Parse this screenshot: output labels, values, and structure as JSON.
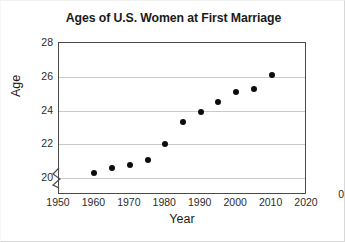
{
  "chart_data": {
    "type": "scatter",
    "title": "Ages of U.S. Women at First Marriage",
    "xlabel": "Year",
    "ylabel": "Age",
    "x": [
      1960,
      1965,
      1970,
      1975,
      1980,
      1985,
      1990,
      1995,
      2000,
      2005,
      2010
    ],
    "values": [
      20.3,
      20.6,
      20.8,
      21.1,
      22.0,
      23.3,
      23.9,
      24.5,
      25.1,
      25.3,
      26.1
    ],
    "xlim": [
      1950,
      2020
    ],
    "ylim": [
      19.0,
      28.0
    ],
    "y_tick_labels": [
      "28",
      "26",
      "24",
      "22",
      "20"
    ],
    "y_tick_values": [
      28,
      26,
      24,
      22,
      20
    ],
    "y_origin_label": "0",
    "x_tick_labels": [
      "1950",
      "1960",
      "1970",
      "1980",
      "1990",
      "2000",
      "2010",
      "2020"
    ],
    "x_tick_values": [
      1950,
      1960,
      1970,
      1980,
      1990,
      2000,
      2010,
      2020
    ],
    "grid": true,
    "grid_axis": "y",
    "legend": null,
    "axis_break": "y-axis break between 0 and 20",
    "marker_color": "#0d0d0d",
    "gridline_color": "#c9c9c9",
    "axis_color": "#4a4a4a"
  }
}
